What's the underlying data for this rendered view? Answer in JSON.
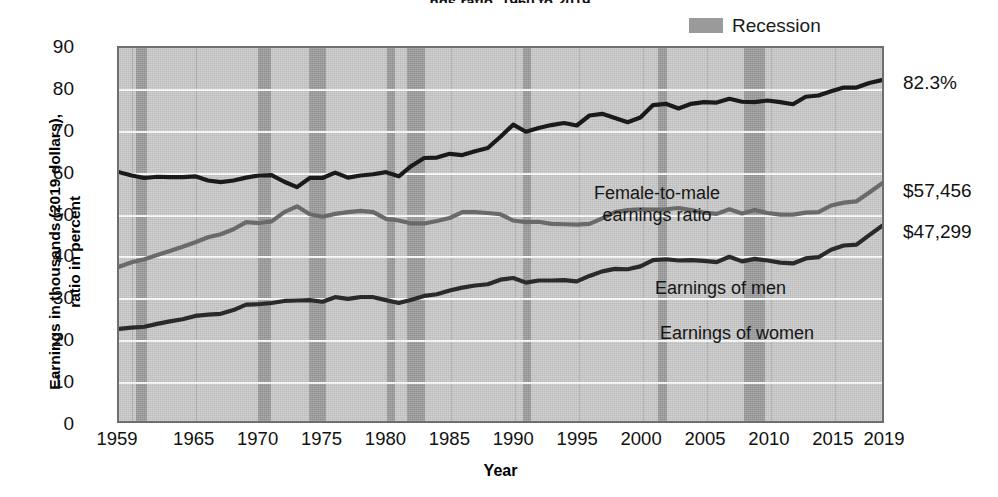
{
  "title_fragment": "ngs ratio, 1960 to 2019",
  "legend": {
    "items": [
      {
        "label": "Recession",
        "color": "#9a9a9a",
        "name": "recession"
      }
    ]
  },
  "axes": {
    "ylabel_line1": "Earnings in thousands (2019 dollars),",
    "ylabel_line2": "ratio in percent",
    "xlabel": "Year",
    "yticks": [
      "0",
      "10",
      "20",
      "30",
      "40",
      "50",
      "60",
      "70",
      "80",
      "90"
    ],
    "xticks": [
      "1959",
      "1965",
      "1970",
      "1975",
      "1980",
      "1985",
      "1990",
      "1995",
      "2000",
      "2005",
      "2010",
      "2015",
      "2019"
    ]
  },
  "annotations": {
    "ratio": "Female-to-male\nearnings ratio",
    "men": "Earnings of men",
    "women": "Earnings of women"
  },
  "end_labels": {
    "ratio": "82.3%",
    "men": "$57,456",
    "women": "$47,299"
  },
  "chart_data": {
    "type": "line",
    "xlabel": "Year",
    "ylabel": "Earnings in thousands (2019 dollars), ratio in percent",
    "xlim": [
      1959,
      2019
    ],
    "ylim": [
      0,
      90
    ],
    "grid": true,
    "legend_position": "top-right",
    "x": [
      1959,
      1960,
      1961,
      1962,
      1963,
      1964,
      1965,
      1966,
      1967,
      1968,
      1969,
      1970,
      1971,
      1972,
      1973,
      1974,
      1975,
      1976,
      1977,
      1978,
      1979,
      1980,
      1981,
      1982,
      1983,
      1984,
      1985,
      1986,
      1987,
      1988,
      1989,
      1990,
      1991,
      1992,
      1993,
      1994,
      1995,
      1996,
      1997,
      1998,
      1999,
      2000,
      2001,
      2002,
      2003,
      2004,
      2005,
      2006,
      2007,
      2008,
      2009,
      2010,
      2011,
      2012,
      2013,
      2014,
      2015,
      2016,
      2017,
      2018,
      2019
    ],
    "series": [
      {
        "name": "Female-to-male earnings ratio",
        "unit": "percent",
        "color": "#1a1a1a",
        "final_value": 82.3,
        "final_label": "82.3%",
        "values": [
          60.2,
          59.4,
          58.8,
          59.1,
          59.0,
          59.0,
          59.2,
          58.2,
          57.8,
          58.2,
          58.9,
          59.4,
          59.5,
          57.9,
          56.6,
          58.8,
          58.8,
          60.1,
          58.9,
          59.4,
          59.7,
          60.2,
          59.2,
          61.7,
          63.6,
          63.7,
          64.6,
          64.3,
          65.2,
          66.0,
          68.7,
          71.6,
          69.9,
          70.8,
          71.5,
          72.0,
          71.4,
          73.8,
          74.2,
          73.2,
          72.2,
          73.3,
          76.3,
          76.6,
          75.5,
          76.6,
          77.0,
          76.9,
          77.8,
          77.1,
          77.0,
          77.4,
          77.0,
          76.5,
          78.3,
          78.6,
          79.6,
          80.5,
          80.5,
          81.6,
          82.3
        ]
      },
      {
        "name": "Earnings of men",
        "unit": "thousands of 2019 dollars",
        "color": "#6a6a6a",
        "final_value": 57.456,
        "final_label": "$57,456",
        "values": [
          37.5,
          38.6,
          39.3,
          40.3,
          41.3,
          42.3,
          43.4,
          44.6,
          45.3,
          46.5,
          48.2,
          48.0,
          48.4,
          50.6,
          52.0,
          50.1,
          49.5,
          50.2,
          50.6,
          50.9,
          50.6,
          49.0,
          48.6,
          47.9,
          47.9,
          48.5,
          49.2,
          50.6,
          50.6,
          50.4,
          50.1,
          48.6,
          48.2,
          48.3,
          47.8,
          47.7,
          47.6,
          47.8,
          49.1,
          50.6,
          51.1,
          51.3,
          51.2,
          51.3,
          51.6,
          51.1,
          50.5,
          50.2,
          51.3,
          50.3,
          51.1,
          50.4,
          50.0,
          50.0,
          50.5,
          50.6,
          52.2,
          52.9,
          53.2,
          55.3,
          57.5
        ]
      },
      {
        "name": "Earnings of women",
        "unit": "thousands of 2019 dollars",
        "color": "#2a2a2a",
        "final_value": 47.299,
        "final_label": "$47,299",
        "values": [
          22.6,
          22.9,
          23.1,
          23.8,
          24.4,
          24.9,
          25.7,
          26.0,
          26.2,
          27.1,
          28.4,
          28.5,
          28.8,
          29.3,
          29.4,
          29.5,
          29.1,
          30.2,
          29.8,
          30.2,
          30.2,
          29.5,
          28.8,
          29.6,
          30.5,
          30.9,
          31.8,
          32.5,
          33.0,
          33.3,
          34.4,
          34.8,
          33.7,
          34.2,
          34.2,
          34.3,
          34.0,
          35.3,
          36.4,
          37.0,
          36.9,
          37.6,
          39.1,
          39.3,
          39.0,
          39.1,
          38.9,
          38.6,
          39.9,
          38.8,
          39.4,
          39.0,
          38.5,
          38.3,
          39.5,
          39.8,
          41.6,
          42.6,
          42.8,
          45.1,
          47.3
        ]
      }
    ],
    "recessions": [
      {
        "start": 1960.3,
        "end": 1961.2
      },
      {
        "start": 1969.9,
        "end": 1970.9
      },
      {
        "start": 1973.9,
        "end": 1975.2
      },
      {
        "start": 1980.0,
        "end": 1980.6
      },
      {
        "start": 1981.5,
        "end": 1982.9
      },
      {
        "start": 1990.6,
        "end": 1991.2
      },
      {
        "start": 2001.2,
        "end": 2001.9
      },
      {
        "start": 2007.9,
        "end": 2009.5
      }
    ]
  }
}
